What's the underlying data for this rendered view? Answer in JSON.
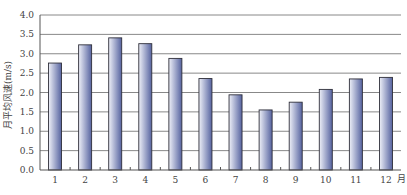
{
  "chart_data": {
    "type": "bar",
    "title": "",
    "xlabel": "月",
    "ylabel": "月平均风速(m/s)",
    "categories": [
      "1",
      "2",
      "3",
      "4",
      "5",
      "6",
      "7",
      "8",
      "9",
      "10",
      "11",
      "12"
    ],
    "values": [
      2.76,
      3.23,
      3.41,
      3.26,
      2.88,
      2.36,
      1.94,
      1.55,
      1.75,
      2.08,
      2.35,
      2.39
    ],
    "ylim": [
      0.0,
      4.0
    ],
    "yticks": [
      "0.0",
      "0.5",
      "1.0",
      "1.5",
      "2.0",
      "2.5",
      "3.0",
      "3.5",
      "4.0"
    ],
    "grid": true,
    "legend": null
  },
  "colors": {
    "bar_light": "#eef0f8",
    "bar_dark": "#55629f",
    "bar_outline": "#2f2f3a",
    "grid": "#888888",
    "axis": "#555555"
  }
}
